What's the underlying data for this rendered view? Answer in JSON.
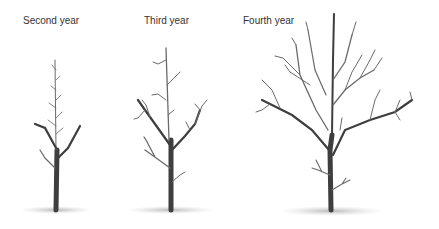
{
  "figure": {
    "panels": [
      {
        "label": "Second year"
      },
      {
        "label": "Third year"
      },
      {
        "label": "Fourth year"
      }
    ]
  }
}
